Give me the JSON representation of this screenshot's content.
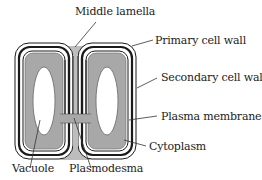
{
  "diagram": {
    "type": "plant cell wall structure (two adjacent cells)",
    "labels": {
      "middle_lamella": "Middle lamella",
      "primary_cell_wall": "Primary cell wall",
      "secondary_cell_wall": "Secondary cell wall",
      "plasma_membrane": "Plasma membrane",
      "cytoplasm": "Cytoplasm",
      "vacuole": "Vacuole",
      "plasmodesma": "Plasmodesma"
    },
    "colors": {
      "cytoplasm": "#a8a8a8",
      "middle_lamella": "#bdbdbd",
      "wall_line": "#1a1a1a",
      "vacuole": "#ffffff",
      "background": "#ffffff"
    }
  }
}
